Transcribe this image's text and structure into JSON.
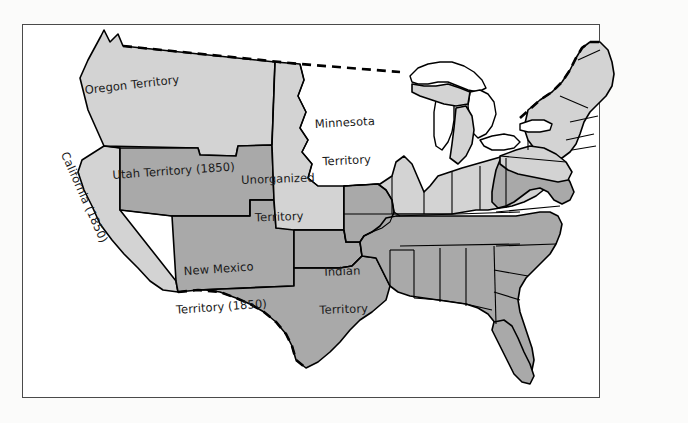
{
  "map": {
    "title_visible": false,
    "background_color": "#ffffff",
    "page_color": "#fbfbfa",
    "frame_color": "#4a4a4a",
    "outline_color": "#000000",
    "fills": {
      "free": "#d3d3d3",
      "slave": "#a9a9a9",
      "water": "#ffffff"
    },
    "labels": [
      {
        "id": "oregon",
        "text": "Oregon Territory",
        "fill": "free"
      },
      {
        "id": "minnesota",
        "text": "Minnesota\nTerritory",
        "fill": "free"
      },
      {
        "id": "unorganized",
        "text": "Unorganized\nTerritory",
        "fill": "free"
      },
      {
        "id": "utah",
        "text": "Utah Territory (1850)",
        "fill": "slave"
      },
      {
        "id": "newmexico",
        "text": "New Mexico\nTerritory (1850)",
        "fill": "slave"
      },
      {
        "id": "indian",
        "text": "Indian\nTerritory",
        "fill": "slave"
      },
      {
        "id": "california",
        "text": "California (1850)",
        "fill": "free"
      }
    ],
    "label_text": {
      "oregon": "Oregon Territory",
      "minnesota_line1": "Minnesota",
      "minnesota_line2": "Territory",
      "unorganized_line1": "Unorganized",
      "unorganized_line2": "Territory",
      "utah": "Utah Territory (1850)",
      "newmexico_line1": "New Mexico",
      "newmexico_line2": "Territory (1850)",
      "indian_line1": "Indian",
      "indian_line2": "Territory",
      "california": "California (1850)"
    },
    "boundaries": {
      "national_border_style": "dashed",
      "state_border_style": "solid"
    }
  }
}
